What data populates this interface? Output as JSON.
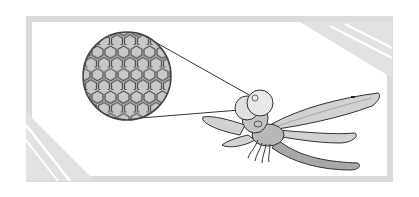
{
  "figure": {
    "colors": {
      "background": "#ffffff",
      "frame": "#dcdcdc",
      "hex_fill": "#c8c8c8",
      "hex_stroke": "#505050",
      "line": "#333333",
      "body": "#b4b4b4",
      "wing": "#d0d0d0"
    }
  }
}
